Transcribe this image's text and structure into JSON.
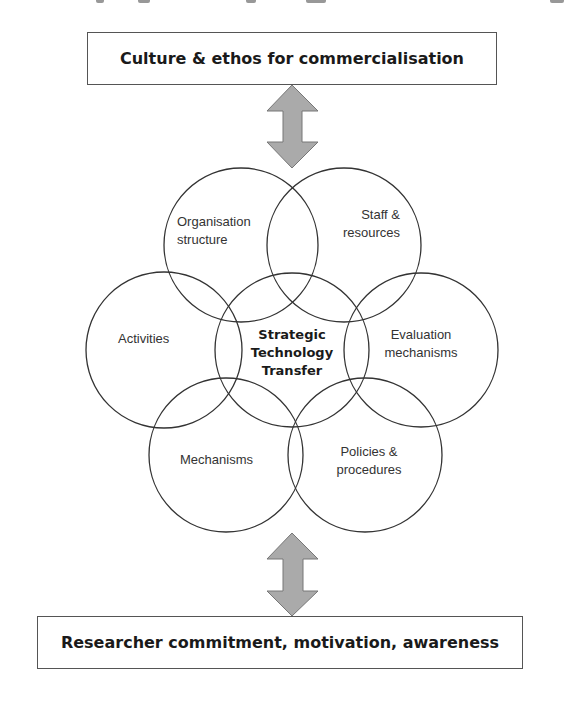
{
  "diagram": {
    "top_box": {
      "label": "Culture & ethos for commercialisation"
    },
    "bottom_box": {
      "label": "Researcher commitment, motivation, awareness"
    },
    "center": {
      "line1": "Strategic",
      "line2": "Technology",
      "line3": "Transfer"
    },
    "circles": [
      {
        "id": "organisation-structure",
        "line1": "Organisation",
        "line2": "structure"
      },
      {
        "id": "staff-resources",
        "line1": "Staff &",
        "line2": "resources"
      },
      {
        "id": "activities",
        "line1": "Activities"
      },
      {
        "id": "evaluation-mechanisms",
        "line1": "Evaluation",
        "line2": "mechanisms"
      },
      {
        "id": "mechanisms",
        "line1": "Mechanisms"
      },
      {
        "id": "policies-procedures",
        "line1": "Policies &",
        "line2": "procedures"
      }
    ],
    "arrows": [
      {
        "id": "top-arrow",
        "type": "double-headed",
        "connects": "top_box-center"
      },
      {
        "id": "bottom-arrow",
        "type": "double-headed",
        "connects": "center-bottom_box"
      }
    ],
    "colors": {
      "stroke": "#333333",
      "arrow_fill": "#aaaaaa",
      "arrow_stroke": "#777777",
      "box_border": "#555555",
      "text": "#1a1a1a"
    }
  }
}
